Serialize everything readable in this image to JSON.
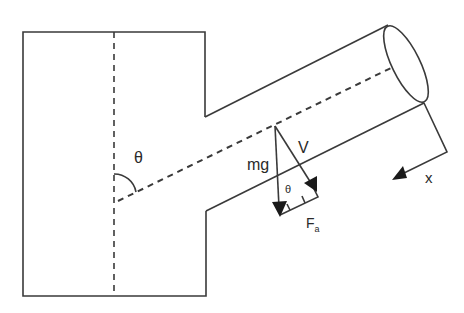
{
  "diagram": {
    "colors": {
      "stroke": "#3a3a3a",
      "background": "#ffffff"
    },
    "labels": {
      "theta_main": "θ",
      "mg": "mg",
      "v": "V",
      "theta_small": "θ",
      "fa_main": "F",
      "fa_sub": "a",
      "x": "x"
    },
    "elements": [
      "tank-outline",
      "tank-vertical-centerline",
      "branch-pipe-upper-wall",
      "branch-pipe-lower-wall",
      "pipe-end-ellipse",
      "branch-centerline",
      "angle-arc-theta",
      "mg-arrow",
      "v-arrow",
      "fa-component-box",
      "x-axis-arrow"
    ]
  }
}
